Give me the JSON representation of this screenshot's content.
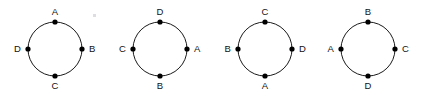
{
  "figure": {
    "background_color": "#ffffff",
    "stroke_color": "#1a1a1a",
    "dot_color": "#000000",
    "label_color": "#111111",
    "circles": [
      {
        "id": "circle-1",
        "center_x": 55,
        "center_y": 49,
        "radius": 27,
        "nodes": [
          {
            "position": "top",
            "label": "A"
          },
          {
            "position": "right",
            "label": "B"
          },
          {
            "position": "bottom",
            "label": "C"
          },
          {
            "position": "left",
            "label": "D"
          }
        ]
      },
      {
        "id": "circle-2",
        "center_x": 160,
        "center_y": 49,
        "radius": 27,
        "nodes": [
          {
            "position": "top",
            "label": "D"
          },
          {
            "position": "right",
            "label": "A"
          },
          {
            "position": "bottom",
            "label": "B"
          },
          {
            "position": "left",
            "label": "C"
          }
        ]
      },
      {
        "id": "circle-3",
        "center_x": 265,
        "center_y": 49,
        "radius": 27,
        "nodes": [
          {
            "position": "top",
            "label": "C"
          },
          {
            "position": "right",
            "label": "D"
          },
          {
            "position": "bottom",
            "label": "A"
          },
          {
            "position": "left",
            "label": "B"
          }
        ]
      },
      {
        "id": "circle-4",
        "center_x": 368,
        "center_y": 49,
        "radius": 27,
        "nodes": [
          {
            "position": "top",
            "label": "B"
          },
          {
            "position": "right",
            "label": "C"
          },
          {
            "position": "bottom",
            "label": "D"
          },
          {
            "position": "left",
            "label": "A"
          }
        ]
      }
    ],
    "artifact_specks": [
      {
        "x": 93,
        "y": 14
      }
    ]
  }
}
